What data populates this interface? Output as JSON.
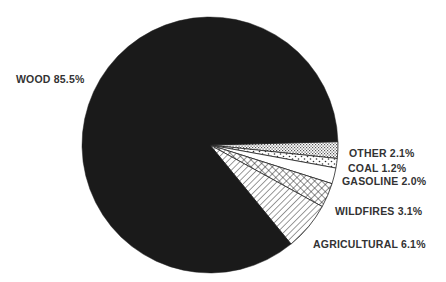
{
  "chart_data": {
    "type": "pie",
    "title": "",
    "start_angle_deg": -1.5,
    "direction": "clockwise",
    "center": [
      210,
      145
    ],
    "radius": 128,
    "slices": [
      {
        "name": "OTHER",
        "value": 2.1,
        "label": "OTHER 2.1%",
        "pattern": "fine-dots",
        "label_pos": [
          349,
          157
        ]
      },
      {
        "name": "COAL",
        "value": 1.2,
        "label": "COAL 1.2%",
        "pattern": "sparse-dots",
        "label_pos": [
          348,
          172
        ]
      },
      {
        "name": "GASOLINE",
        "value": 2.0,
        "label": "GASOLINE 2.0%",
        "pattern": "white",
        "label_pos": [
          342,
          185
        ]
      },
      {
        "name": "WILDFIRES",
        "value": 3.1,
        "label": "WILDFIRES 3.1%",
        "pattern": "crosshatch",
        "label_pos": [
          335,
          215
        ]
      },
      {
        "name": "AGRICULTURAL",
        "value": 6.1,
        "label": "AGRICULTURAL 6.1%",
        "pattern": "diagonal",
        "label_pos": [
          313,
          248
        ]
      },
      {
        "name": "WOOD",
        "value": 85.5,
        "label": "WOOD 85.5%",
        "pattern": "solid-black",
        "label_pos": [
          16,
          83
        ]
      }
    ],
    "legend": "none (direct labels)"
  },
  "colors": {
    "wood_fill": "#1a1a1a",
    "outline": "#222222",
    "label_text": "#333333",
    "background": "#ffffff"
  }
}
